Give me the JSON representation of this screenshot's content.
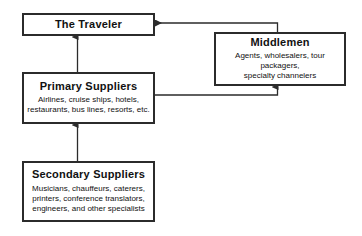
{
  "diagram": {
    "stroke_color": "#2b2b2b",
    "text_color": "#111111",
    "background_color": "#ffffff",
    "nodes": [
      {
        "id": "traveler",
        "title": "The Traveler",
        "desc": ""
      },
      {
        "id": "middlemen",
        "title": "Middlemen",
        "desc": "Agents, wholesalers, tour packagers,\nspecialty channelers"
      },
      {
        "id": "primary",
        "title": "Primary Suppliers",
        "desc": "Airlines, cruise ships, hotels,\nrestaurants, bus lines, resorts, etc."
      },
      {
        "id": "secondary",
        "title": "Secondary Suppliers",
        "desc": "Musicians, chauffeurs, caterers,\nprinters, conference translators,\nengineers, and other specialists"
      }
    ],
    "connectors": [
      {
        "id": "primary-to-traveler",
        "from": "primary",
        "to": "traveler",
        "label": ""
      },
      {
        "id": "secondary-to-primary",
        "from": "secondary",
        "to": "primary",
        "label": ""
      },
      {
        "id": "primary-to-middlemen",
        "from": "primary",
        "to": "middlemen",
        "label": ""
      },
      {
        "id": "middlemen-to-traveler",
        "from": "middlemen",
        "to": "traveler",
        "label": ""
      }
    ]
  }
}
